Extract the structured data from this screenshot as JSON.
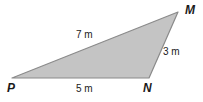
{
  "figure": {
    "name": "triangle-PMN",
    "background_color": "#ffffff",
    "fill_color": "#c4c4c4",
    "stroke_color": "#8a8a8a",
    "text_color": "#1a1a1a",
    "vertices": [
      {
        "id": "P",
        "label": "P",
        "x": 12,
        "y": 78
      },
      {
        "id": "N",
        "label": "N",
        "x": 149,
        "y": 78
      },
      {
        "id": "M",
        "label": "M",
        "x": 178,
        "y": 12
      }
    ],
    "sides": [
      {
        "id": "PM",
        "label": "7 m",
        "value": 7,
        "unit": "m",
        "from": "P",
        "to": "M"
      },
      {
        "id": "MN",
        "label": "3 m",
        "value": 3,
        "unit": "m",
        "from": "M",
        "to": "N"
      },
      {
        "id": "PN",
        "label": "5 m",
        "value": 5,
        "unit": "m",
        "from": "P",
        "to": "N"
      }
    ]
  }
}
